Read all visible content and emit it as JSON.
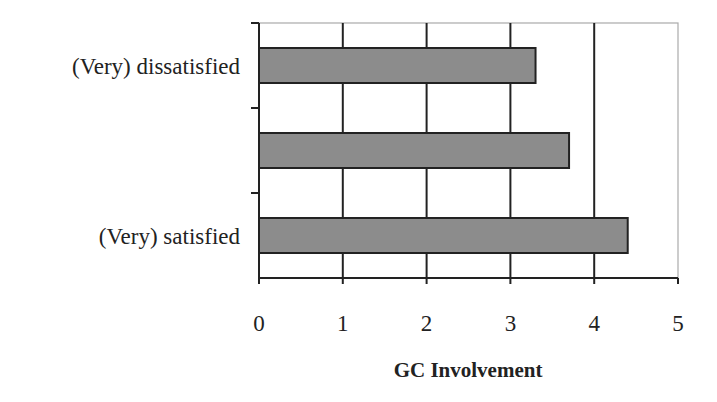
{
  "chart_data": {
    "type": "bar",
    "orientation": "horizontal",
    "title": "",
    "categories": [
      "(Very) dissatisfied",
      "",
      "(Very) satisfied"
    ],
    "values": [
      3.3,
      3.7,
      4.4
    ],
    "xlabel": "GC Involvement",
    "ylabel": "",
    "xlim": [
      0,
      5
    ],
    "xticks": [
      "0",
      "1",
      "2",
      "3",
      "4",
      "5"
    ],
    "grid": "vertical",
    "legend": null,
    "colors": {
      "bar_fill": "#8c8c8c",
      "bar_stroke": "#222222",
      "grid": "#222222",
      "border": "#aaaaaa"
    }
  }
}
